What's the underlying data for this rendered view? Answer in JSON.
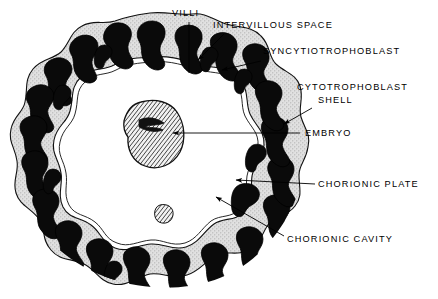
{
  "figure": {
    "name": "placenta-cross-section-diagram",
    "background_color": "#ffffff",
    "colors": {
      "villi_black": "#0a0a0a",
      "intervillous_white": "#ffffff",
      "shell_stipple_gray": "#d8d8d8",
      "embryo_hatch_gray": "#8a8a8a",
      "outline_black": "#000000",
      "leader_line": "#000000"
    }
  },
  "labels": [
    {
      "id": "villi",
      "text": "VILLI",
      "x": 172,
      "y": 16,
      "anchor": "start",
      "leader": {
        "type": "line",
        "x1": 189,
        "y1": 22,
        "x2": 189,
        "y2": 73
      }
    },
    {
      "id": "intervillous-space",
      "text": "INTERVILLOUS SPACE",
      "x": 213,
      "y": 28,
      "anchor": "start",
      "leader": {
        "type": "arrow",
        "x1": 224,
        "y1": 34,
        "x2": 196,
        "y2": 61
      }
    },
    {
      "id": "syncytiotrophoblast",
      "text": "SYNCYTIOTROPHOBLAST",
      "x": 263,
      "y": 54,
      "anchor": "start",
      "leader": {
        "type": "arrow",
        "x1": 261,
        "y1": 60,
        "x2": 220,
        "y2": 70
      }
    },
    {
      "id": "cytotrophoblast-shell",
      "text": "CYTOTROPHOBLAST",
      "text_line2": "SHELL",
      "x": 297,
      "y": 90,
      "x2": 318,
      "y2": 103,
      "anchor": "start",
      "leader": {
        "type": "arrow",
        "x1": 312,
        "y1": 108,
        "x2": 281,
        "y2": 126
      }
    },
    {
      "id": "embryo",
      "text": "EMBRYO",
      "x": 305,
      "y": 136,
      "anchor": "start",
      "leader": {
        "type": "arrow",
        "x1": 300,
        "y1": 133,
        "x2": 171,
        "y2": 133
      }
    },
    {
      "id": "chorionic-plate",
      "text": "CHORIONIC PLATE",
      "x": 318,
      "y": 187,
      "anchor": "start",
      "leader": {
        "type": "arrow",
        "x1": 315,
        "y1": 184,
        "x2": 234,
        "y2": 180
      }
    },
    {
      "id": "chorionic-cavity",
      "text": "CHORIONIC CAVITY",
      "x": 287,
      "y": 242,
      "anchor": "start",
      "leader": {
        "type": "arrow",
        "x1": 284,
        "y1": 236,
        "x2": 214,
        "y2": 196
      }
    }
  ],
  "structures": {
    "outer_shell": {
      "name": "cytotrophoblast-shell-ring",
      "description": "lobulated stippled-gray annular band forming the chorion wall"
    },
    "villi": {
      "name": "chorionic-villi",
      "description": "solid black branched blobs embedded in the ring",
      "count": 30
    },
    "intervillous_space": {
      "name": "intervillous-space",
      "description": "white lacunar gaps between black villi"
    },
    "chorionic_cavity": {
      "name": "chorionic-cavity",
      "description": "large central white void enclosed by the ring"
    },
    "embryo": {
      "name": "embryo",
      "description": "bean/kidney-shaped gray hatched mass suspended in the upper-central cavity"
    },
    "nodule": {
      "name": "inner-wall-nodule",
      "description": "small hatched nodule projecting from inner wall at lower ring"
    }
  }
}
